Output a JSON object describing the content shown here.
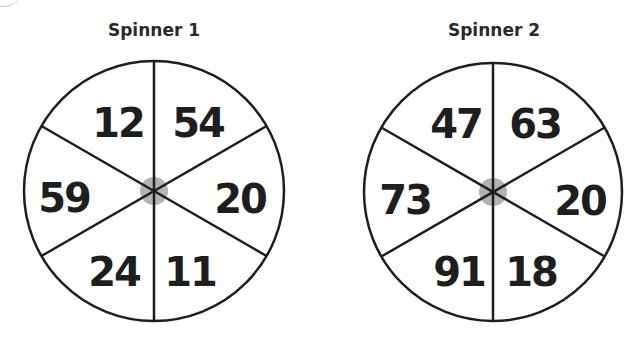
{
  "spinners": [
    {
      "title": "Spinner 1",
      "center": [
        154,
        191
      ],
      "radius": 131,
      "hub_color": "#b3b3b3",
      "sections": [
        {
          "position": "top-left",
          "value": "12"
        },
        {
          "position": "top-right",
          "value": "54"
        },
        {
          "position": "right",
          "value": "20"
        },
        {
          "position": "bottom-right",
          "value": "11"
        },
        {
          "position": "bottom-left",
          "value": "24"
        },
        {
          "position": "left",
          "value": "59"
        }
      ]
    },
    {
      "title": "Spinner 2",
      "center": [
        493,
        192
      ],
      "radius": 129,
      "hub_color": "#b3b3b3",
      "sections": [
        {
          "position": "top-left",
          "value": "47"
        },
        {
          "position": "top-right",
          "value": "63"
        },
        {
          "position": "right",
          "value": "20"
        },
        {
          "position": "bottom-right",
          "value": "18"
        },
        {
          "position": "bottom-left",
          "value": "91"
        },
        {
          "position": "left",
          "value": "73"
        }
      ]
    }
  ]
}
